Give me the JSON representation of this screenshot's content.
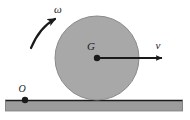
{
  "figure": {
    "background_color": "#ffffff",
    "width": 190,
    "height": 120
  },
  "labels": {
    "angular_velocity": "ω",
    "center_of_mass": "G",
    "velocity": "v",
    "contact_reference_point": "O"
  },
  "disk": {
    "name": "rolling disk",
    "center_x": 97,
    "center_y": 58,
    "radius": 42,
    "fill_color": "#a8a8a8",
    "stroke_color": "#7a7a7a"
  },
  "ground": {
    "name": "horizontal surface",
    "left": 5,
    "top": 100,
    "width": 178,
    "height": 11,
    "fill_color": "#9c9c9c",
    "stroke_color": "#1a1a1a"
  },
  "center_point": {
    "name": "G",
    "x": 97,
    "y": 58,
    "radius": 3,
    "color": "#1a1a1a"
  },
  "origin_point": {
    "name": "O",
    "x": 25,
    "y": 100,
    "radius": 3,
    "color": "#1a1a1a"
  },
  "velocity_arrow": {
    "name": "velocity vector v",
    "from_x": 97,
    "from_y": 58,
    "to_x": 168,
    "to_y": 58,
    "color": "#1a1a1a",
    "direction": "right"
  },
  "omega_arrow": {
    "name": "angular velocity arc arrow",
    "color": "#1a1a1a",
    "direction": "counterclockwise",
    "start_x": 32,
    "start_y": 47,
    "end_x": 60,
    "end_y": 17
  },
  "label_positions": {
    "omega": {
      "x": 58,
      "y": 13
    },
    "G": {
      "x": 91,
      "y": 50
    },
    "v": {
      "x": 158,
      "y": 48
    },
    "O": {
      "x": 21,
      "y": 92
    }
  },
  "colors": {
    "disk_fill": "#a8a8a8",
    "ground_fill": "#9c9c9c",
    "ink": "#1a1a1a",
    "page": "#ffffff"
  }
}
